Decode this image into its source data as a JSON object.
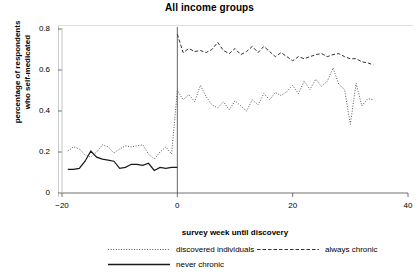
{
  "chart_data": {
    "type": "line",
    "title": "All income groups",
    "xlabel": "survey week until discovery",
    "ylabel_line1": "percentage of respondents",
    "ylabel_line2": "who self-medicated",
    "xlim": [
      -20,
      40
    ],
    "ylim": [
      0,
      0.8
    ],
    "xticks": [
      -20,
      0,
      20,
      40
    ],
    "xtick_labels": [
      "−20",
      "0",
      "20",
      "40"
    ],
    "yticks": [
      0,
      0.2,
      0.4,
      0.6,
      0.8
    ],
    "ytick_labels": [
      "0",
      "0.2",
      "0.4",
      "0.6",
      "0.8"
    ],
    "grid": false,
    "legend_position": "bottom",
    "vline_x": 0,
    "series": [
      {
        "name": "discovered individuals",
        "style": "dotted",
        "color": "#555555",
        "x": [
          -19,
          -18,
          -17,
          -16,
          -15,
          -14,
          -13,
          -12,
          -11,
          -10,
          -9,
          -8,
          -7,
          -6,
          -5,
          -4,
          -3,
          -2,
          -1,
          0,
          1,
          2,
          3,
          4,
          5,
          6,
          7,
          8,
          9,
          10,
          11,
          12,
          13,
          14,
          15,
          16,
          17,
          18,
          19,
          20,
          21,
          22,
          23,
          24,
          25,
          26,
          27,
          28,
          29,
          30,
          31,
          32,
          33,
          34
        ],
        "y": [
          0.205,
          0.225,
          0.215,
          0.185,
          0.175,
          0.2,
          0.235,
          0.225,
          0.195,
          0.215,
          0.23,
          0.225,
          0.23,
          0.235,
          0.19,
          0.165,
          0.2,
          0.225,
          0.19,
          0.5,
          0.455,
          0.48,
          0.445,
          0.525,
          0.47,
          0.43,
          0.415,
          0.445,
          0.405,
          0.45,
          0.425,
          0.4,
          0.455,
          0.43,
          0.485,
          0.455,
          0.49,
          0.475,
          0.495,
          0.525,
          0.485,
          0.545,
          0.505,
          0.555,
          0.52,
          0.545,
          0.61,
          0.53,
          0.505,
          0.335,
          0.535,
          0.425,
          0.46,
          0.455
        ]
      },
      {
        "name": "always chronic",
        "style": "dashed",
        "color": "#333333",
        "x": [
          0,
          1,
          2,
          3,
          4,
          5,
          6,
          7,
          8,
          9,
          10,
          11,
          12,
          13,
          14,
          15,
          16,
          17,
          18,
          19,
          20,
          21,
          22,
          23,
          24,
          25,
          26,
          27,
          28,
          29,
          30,
          31,
          32,
          33,
          34
        ],
        "y": [
          0.775,
          0.685,
          0.705,
          0.69,
          0.695,
          0.685,
          0.7,
          0.735,
          0.695,
          0.68,
          0.705,
          0.675,
          0.69,
          0.715,
          0.685,
          0.715,
          0.69,
          0.665,
          0.685,
          0.665,
          0.645,
          0.665,
          0.655,
          0.665,
          0.675,
          0.68,
          0.665,
          0.675,
          0.68,
          0.665,
          0.655,
          0.655,
          0.64,
          0.635,
          0.625
        ]
      },
      {
        "name": "never chronic",
        "style": "solid",
        "color": "#1a1a1a",
        "x": [
          -19,
          -18,
          -17,
          -16,
          -15,
          -14,
          -13,
          -12,
          -11,
          -10,
          -9,
          -8,
          -7,
          -6,
          -5,
          -4,
          -3,
          -2,
          -1,
          0
        ],
        "y": [
          0.115,
          0.115,
          0.12,
          0.155,
          0.205,
          0.175,
          0.165,
          0.16,
          0.155,
          0.12,
          0.125,
          0.14,
          0.14,
          0.135,
          0.145,
          0.11,
          0.125,
          0.12,
          0.125,
          0.125
        ]
      }
    ]
  },
  "legend": {
    "entries": [
      {
        "label": "discovered individuals",
        "style": "dotted"
      },
      {
        "label": "always chronic",
        "style": "dashed"
      },
      {
        "label": "never chronic",
        "style": "solid"
      }
    ]
  }
}
